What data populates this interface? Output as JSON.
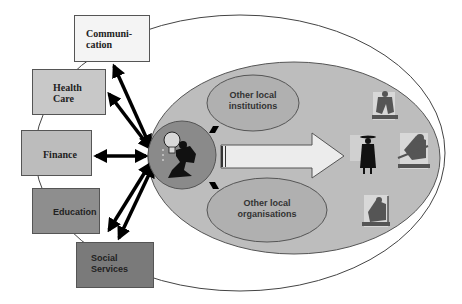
{
  "diagram": {
    "outer_boxes": [
      {
        "id": "communication",
        "label": "Communi-\ncation",
        "fill": "#f4f4f4"
      },
      {
        "id": "health-care",
        "label": "Health\nCare",
        "fill": "#c8c8c8"
      },
      {
        "id": "finance",
        "label": "Finance",
        "fill": "#bcbcbc"
      },
      {
        "id": "education",
        "label": "Education",
        "fill": "#8e8e8e"
      },
      {
        "id": "social-services",
        "label": "Social\nServices",
        "fill": "#7a7a7a"
      }
    ],
    "inner_ellipses": [
      {
        "id": "other-local-institutions",
        "label": "Other local\ninstitutions"
      },
      {
        "id": "other-local-organisations",
        "label": "Other local\norganisations"
      }
    ],
    "colors": {
      "outer_ellipse_stroke": "#444444",
      "inner_ellipse_fill": "#bdbdbd",
      "sub_ellipse_fill": "#b0b0b0",
      "hub_fill": "#8a8a8a",
      "arrow_fill": "#ececec",
      "connector_arrows": "#000000"
    },
    "icons": {
      "hub": "entrepreneur-lightbulb-icon",
      "figures": [
        "farmer-figure-icon",
        "worker-figure-icon",
        "digging-figure-icon",
        "harvest-figure-icon"
      ]
    }
  }
}
